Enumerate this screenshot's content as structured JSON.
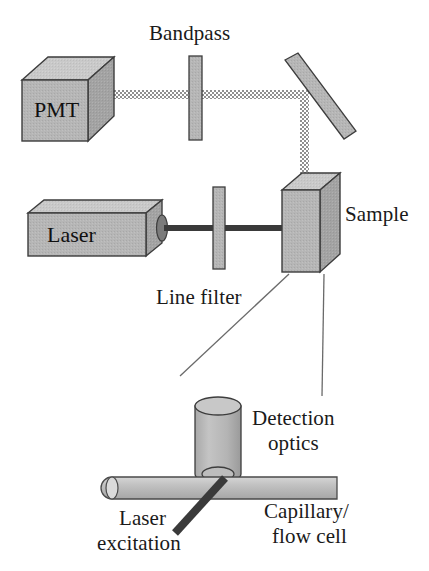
{
  "figure": {
    "background_color": "#ffffff",
    "width": 429,
    "height": 571
  },
  "palette": {
    "body_fill": "#b3b3b3",
    "body_top_fill": "#c9c9c9",
    "body_side_fill": "#a0a0a0",
    "outline": "#3d3d3d",
    "beam_dark": "#3a3a3a",
    "beam_dotted": "#8c8c8c",
    "leader_line": "#5a5a5a",
    "text": "#1a1a1a"
  },
  "components": {
    "pmt": {
      "label": "PMT",
      "icon": "cube-3d-icon"
    },
    "bandpass_filter": {
      "label": "Bandpass",
      "icon": "filter-slab-icon"
    },
    "mirror": {
      "label": "",
      "icon": "mirror-bar-icon"
    },
    "laser": {
      "label": "Laser",
      "icon": "cube-3d-icon"
    },
    "line_filter": {
      "label": "Line filter",
      "icon": "filter-slab-icon"
    },
    "sample": {
      "label": "Sample",
      "icon": "cuvette-3d-icon"
    },
    "detection_optics": {
      "label_line1": "Detection",
      "label_line2": "optics",
      "icon": "cylinder-lens-icon"
    },
    "capillary": {
      "label_line1": "Capillary/",
      "label_line2": "flow cell",
      "icon": "tube-icon"
    },
    "laser_excitation": {
      "label_line1": "Laser",
      "label_line2": "excitation",
      "icon": "beam-bar-icon"
    }
  },
  "beams": {
    "emission_path_style": "dotted",
    "excitation_path_style": "solid"
  }
}
